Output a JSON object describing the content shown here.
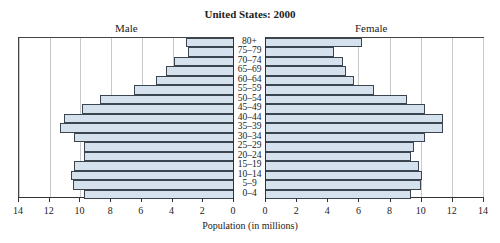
{
  "chart_data": {
    "type": "bar",
    "orientation": "horizontal",
    "title": "United States: 2000",
    "xlabel": "Population (in millions)",
    "ylabel": "",
    "xlim": [
      0,
      14
    ],
    "x_ticks": [
      0,
      2,
      4,
      6,
      8,
      10,
      12,
      14
    ],
    "grid": true,
    "categories": [
      "80+",
      "75–79",
      "70–74",
      "65–69",
      "60–64",
      "55–59",
      "50–54",
      "45–49",
      "40–44",
      "35–39",
      "30–34",
      "25–29",
      "20–24",
      "15–19",
      "10–14",
      "5–9",
      "0–4"
    ],
    "series": [
      {
        "name": "Male",
        "values": [
          3.1,
          3.0,
          3.9,
          4.4,
          5.1,
          6.5,
          8.7,
          9.9,
          11.1,
          11.3,
          10.4,
          9.8,
          9.8,
          10.4,
          10.6,
          10.5,
          9.8
        ]
      },
      {
        "name": "Female",
        "values": [
          6.2,
          4.4,
          5.0,
          5.2,
          5.7,
          7.0,
          9.1,
          10.3,
          11.4,
          11.4,
          10.3,
          9.6,
          9.4,
          9.9,
          10.1,
          10.0,
          9.4
        ]
      }
    ],
    "colors": {
      "bar_fill": "#d5e1ec",
      "bar_border": "#3a4550",
      "grid": "#c8c8c8"
    }
  },
  "labels": {
    "title": "United States: 2000",
    "male": "Male",
    "female": "Female",
    "xlabel": "Population (in millions)"
  }
}
